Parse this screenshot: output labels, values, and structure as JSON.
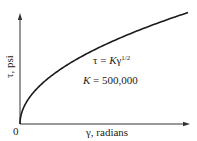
{
  "chart_data": {
    "type": "line",
    "title": "",
    "xlabel": "γ, radians",
    "ylabel": "τ, psi",
    "origin_label": "0",
    "x_ticks": [],
    "y_ticks": [],
    "grid": false,
    "legend": null,
    "annotations": [
      "τ = Kγ^1/2",
      "K = 500,000"
    ],
    "series": [
      {
        "name": "τ = Kγ^(1/2)",
        "function": "tau = K * gamma^0.5",
        "K": 500000,
        "shape": "square-root curve starting at origin, concave down"
      }
    ]
  },
  "labels": {
    "origin": "0",
    "x_axis": "γ, radians",
    "y_axis": "τ, psi",
    "eq_lhs": "τ = ",
    "eq_K": "K",
    "eq_gamma": "γ",
    "eq_exp": "1/2",
    "k_sym": "K",
    "k_val": " = 500,000"
  },
  "colors": {
    "curve": "#1a1a1a",
    "axes": "#333333",
    "background": "#ffffff"
  }
}
